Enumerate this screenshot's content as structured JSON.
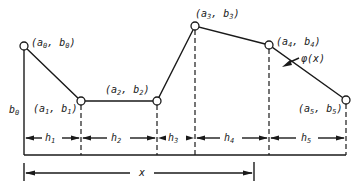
{
  "figure": {
    "curve_label": "φ(x)",
    "points": [
      {
        "label_a": "a",
        "sub_a": "0",
        "label_b": "b",
        "sub_b": "0",
        "x": 24,
        "y": 46
      },
      {
        "label_a": "a",
        "sub_a": "1",
        "label_b": "b",
        "sub_b": "1",
        "x": 81,
        "y": 101
      },
      {
        "label_a": "a",
        "sub_a": "2",
        "label_b": "b",
        "sub_b": "2",
        "x": 157,
        "y": 101
      },
      {
        "label_a": "a",
        "sub_a": "3",
        "label_b": "b",
        "sub_b": "3",
        "x": 195,
        "y": 26
      },
      {
        "label_a": "a",
        "sub_a": "4",
        "label_b": "b",
        "sub_b": "4",
        "x": 269,
        "y": 45
      },
      {
        "label_a": "a",
        "sub_a": "5",
        "label_b": "b",
        "sub_b": "5",
        "x": 346,
        "y": 100
      }
    ],
    "intervals": [
      {
        "label": "h",
        "sub": "1"
      },
      {
        "label": "h",
        "sub": "2"
      },
      {
        "label": "h",
        "sub": "3"
      },
      {
        "label": "h",
        "sub": "4"
      },
      {
        "label": "h",
        "sub": "5"
      }
    ],
    "left_axis_label": {
      "label": "b",
      "sub": "0"
    },
    "x_dimension_label": "x"
  }
}
